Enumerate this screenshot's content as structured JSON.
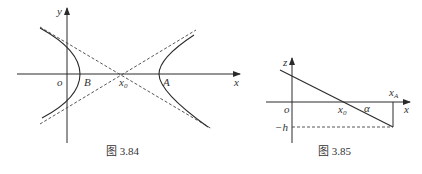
{
  "figures": [
    {
      "caption": "图 3.84",
      "description": "Hyperbola with two branches, center x0 on x-axis, dashed asymptotes",
      "labels": {
        "y_axis": "y",
        "x_axis": "x",
        "origin": "o",
        "point_b": "B",
        "center": "x",
        "center_sub": "0",
        "point_a": "A"
      }
    },
    {
      "caption": "图 3.85",
      "description": "Line crossing x-axis at x0 with angle alpha, reaching depth -h at xA",
      "labels": {
        "z_axis": "z",
        "x_axis": "x",
        "origin": "o",
        "crossing": "x",
        "crossing_sub": "0",
        "angle": "α",
        "end_point": "x",
        "end_point_sub": "A",
        "depth": "−h"
      }
    }
  ]
}
